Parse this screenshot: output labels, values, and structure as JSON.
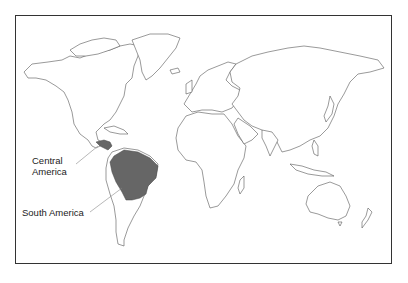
{
  "map": {
    "type": "world outline map",
    "highlight_color": "#666666",
    "highlighted_regions": [
      "Central America",
      "South America (northern portion incl. Amazon basin)"
    ]
  },
  "labels": {
    "central_america_line1": "Central",
    "central_america_line2": "America",
    "south_america": "South America"
  }
}
